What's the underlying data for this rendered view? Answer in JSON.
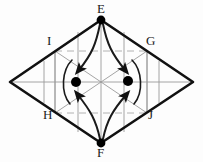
{
  "figure": {
    "background_color": "#fdfdfd",
    "outline_color": "#111111",
    "grid_color": "#9a9a9a",
    "dash_color": "#b0b0b0",
    "curve_color": "#1a1a1a",
    "dot_color": "#000000",
    "label_color": "#1a1a1a",
    "labels": {
      "top": "E",
      "bottom": "F",
      "upper_left": "I",
      "upper_right": "G",
      "lower_left": "H",
      "lower_right": "J"
    },
    "vertices": {
      "top": [
        101,
        20
      ],
      "bottom": [
        101,
        143
      ],
      "left": [
        10,
        82
      ],
      "right": [
        193,
        82
      ]
    },
    "inner_vertices": {
      "upper_left": [
        55,
        51
      ],
      "upper_right": [
        147,
        51
      ],
      "lower_left": [
        55,
        113
      ],
      "lower_right": [
        147,
        113
      ]
    },
    "dots": [
      {
        "name": "left-equilibrium-point",
        "x": 76,
        "y": 82,
        "r": 5
      },
      {
        "name": "right-equilibrium-point",
        "x": 128,
        "y": 81,
        "r": 5
      }
    ],
    "arrows": [
      {
        "name": "arrow-from-top-to-left-dot",
        "from": "E",
        "to": "left dot"
      },
      {
        "name": "arrow-from-top-to-right-dot",
        "from": "E",
        "to": "right dot"
      },
      {
        "name": "arrow-from-bottom-to-left-dot",
        "from": "F",
        "to": "left dot"
      },
      {
        "name": "arrow-from-bottom-to-right-dot",
        "from": "F",
        "to": "right dot"
      }
    ]
  }
}
